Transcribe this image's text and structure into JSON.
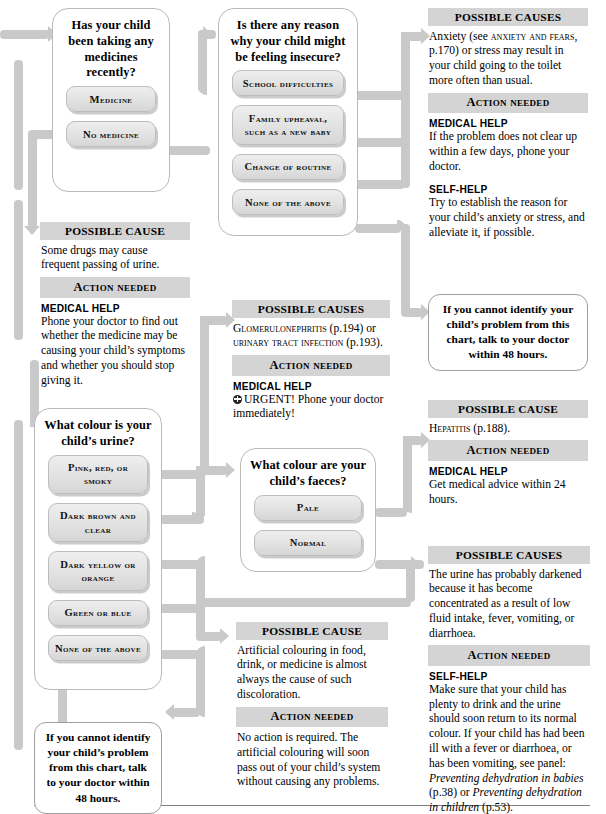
{
  "colors": {
    "connector": "#c9c9c9",
    "header_band": "#d4d4d4",
    "option_fill": "#e2e2e2",
    "panel_border": "#b9b9b9"
  },
  "questions": [
    {
      "id": "medicines",
      "title": "Has your child been taking any medicines recently?",
      "options": [
        "Medicine",
        "No medicine"
      ]
    },
    {
      "id": "insecure",
      "title": "Is there any reason why your child might be feeling insecure?",
      "options": [
        "School difficulties",
        "Family upheaval, such as a new baby",
        "Change of routine",
        "None of the above"
      ]
    },
    {
      "id": "urine-colour",
      "title": "What colour is your child’s urine?",
      "options": [
        "Pink, red, or smoky",
        "Dark brown and clear",
        "Dark yellow or orange",
        "Green or blue",
        "None of the above"
      ]
    },
    {
      "id": "faeces-colour",
      "title": "What colour are your child’s faeces?",
      "options": [
        "Pale",
        "Normal"
      ]
    }
  ],
  "advice": [
    {
      "id": "drugs",
      "cause_heading": "POSSIBLE CAUSE",
      "cause_text": "Some drugs may cause frequent passing of urine.",
      "action_heading": "Action needed",
      "items": [
        {
          "label": "MEDICAL HELP",
          "text": "Phone your doctor to find out whether the medicine may be causing your child’s symptoms and whether you should stop giving it."
        }
      ]
    },
    {
      "id": "anxiety",
      "cause_heading": "POSSIBLE CAUSES",
      "cause_text_pre": "Anxiety (see ",
      "cause_text_sc": "anxiety and fears",
      "cause_text_post": ", p.170) or stress may result in your child going to the toilet more often than usual.",
      "action_heading": "Action needed",
      "items": [
        {
          "label": "MEDICAL HELP",
          "text": "If the problem does not clear up within a few days, phone your doctor."
        },
        {
          "label": "SELF-HELP",
          "text": "Try to establish the reason for your child’s anxiety or stress, and alleviate it, if possible."
        }
      ]
    },
    {
      "id": "glomerulonephritis",
      "cause_heading": "POSSIBLE CAUSES",
      "cause_sc_1": "Glomerulonephritis",
      "cause_mid": " (p.194) or ",
      "cause_sc_2": "urinary tract infection",
      "cause_end": " (p.193).",
      "action_heading": "Action needed",
      "items": [
        {
          "label": "MEDICAL HELP",
          "text": "URGENT! Phone your doctor immediately!",
          "urgent": true
        }
      ]
    },
    {
      "id": "hepatitis",
      "cause_heading": "POSSIBLE CAUSE",
      "cause_sc_1": "Hepatitis",
      "cause_end": " (p.188).",
      "action_heading": "Action needed",
      "items": [
        {
          "label": "MEDICAL HELP",
          "text": "Get medical advice within 24 hours."
        }
      ]
    },
    {
      "id": "concentrated-urine",
      "cause_heading": "POSSIBLE CAUSES",
      "cause_text": "The urine has probably darkened because it has become concentrated as a result of low fluid intake, fever, vomiting, or diarrhoea.",
      "action_heading": "Action needed",
      "items": [
        {
          "label": "SELF-HELP",
          "text": "Make sure that your child has plenty to drink and the urine should soon return to its normal colour. If your child has had been ill with a fever or diarrhoea, or has been vomiting, see panel: ",
          "italic_1": "Preventing dehydration in babies",
          "mid": " (p.38) or ",
          "italic_2": "Preventing dehydration in children",
          "end": " (p.53)."
        }
      ]
    },
    {
      "id": "artificial-colouring",
      "cause_heading": "POSSIBLE CAUSE",
      "cause_text": "Artificial colouring in food, drink, or medicine is almost always the cause of such discoloration.",
      "action_heading": "Action needed",
      "items": [
        {
          "label": "",
          "text": "No action is required. The artificial colouring will soon pass out of your child’s system without causing any problems."
        }
      ]
    }
  ],
  "notes": [
    {
      "id": "cannot-identify-right",
      "text": "If you cannot identify your child’s problem from this chart, talk to your doctor within 48 hours."
    },
    {
      "id": "cannot-identify-left",
      "text": "If you cannot identify your child’s problem from this chart, talk to your doctor within 48 hours."
    }
  ]
}
